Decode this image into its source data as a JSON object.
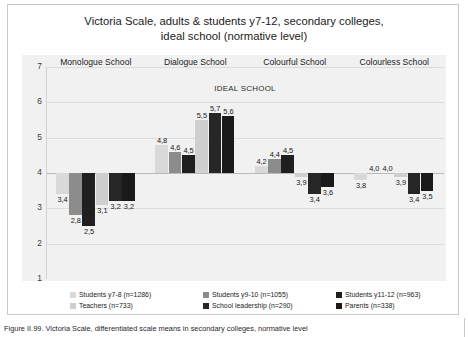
{
  "figure": {
    "caption": "Figure II.99. Victoria Scale, differentiated scale means in secondary colleges, normative level"
  },
  "chart_data": {
    "type": "bar",
    "title": "Victoria Scale, adults & students y7-12, secondary colleges, ideal school (normative level)",
    "title_line1": "Victoria Scale, adults & students y7-12, secondary colleges,",
    "title_line2": "ideal school (normative level)",
    "panel_label": "IDEAL SCHOOL",
    "xlabel": "",
    "ylabel": "",
    "ylim": [
      1,
      7
    ],
    "yticks": [
      "7",
      "6",
      "5",
      "4",
      "3",
      "2",
      "1"
    ],
    "grid": true,
    "legend_position": "bottom",
    "categories": [
      "Monologue School",
      "Dialogue School",
      "Colourful School",
      "Colourless School"
    ],
    "series": [
      {
        "name": "Students y7-8 (n=1286)",
        "color": "#d9d9d9",
        "values": [
          3.4,
          4.8,
          4.2,
          3.8
        ]
      },
      {
        "name": "Students y9-10 (n=1055)",
        "color": "#8c8c8c",
        "values": [
          2.8,
          4.6,
          4.4,
          4.0
        ]
      },
      {
        "name": "Students y11-12 (n=963)",
        "color": "#1f1f1f",
        "values": [
          2.5,
          4.5,
          4.5,
          4.0
        ]
      },
      {
        "name": "Teachers (n=733)",
        "color": "#cfcfcf",
        "values": [
          3.1,
          5.5,
          3.9,
          3.9
        ]
      },
      {
        "name": "School leadership (n=290)",
        "color": "#262626",
        "values": [
          3.2,
          5.7,
          3.4,
          3.4
        ]
      },
      {
        "name": "Parents (n=338)",
        "color": "#1a1a1a",
        "values": [
          3.2,
          5.6,
          3.6,
          3.5
        ]
      }
    ],
    "value_labels": [
      [
        "3,4",
        "2,8",
        "2,5",
        "3,1",
        "3,2",
        "3,2"
      ],
      [
        "4,8",
        "4,6",
        "4,5",
        "5,5",
        "5,7",
        "5,6"
      ],
      [
        "4,2",
        "4,4",
        "4,5",
        "3,9",
        "3,4",
        "3,6"
      ],
      [
        "3,8",
        "4,0",
        "4,0",
        "3,9",
        "3,4",
        "3,5"
      ]
    ]
  }
}
